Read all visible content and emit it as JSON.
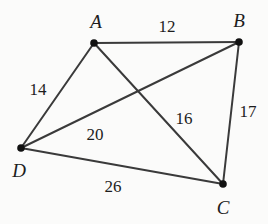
{
  "canvas": {
    "width": 268,
    "height": 224,
    "background_color": "#fbfbfa",
    "line_color": "#3a3a3a",
    "vertex_color": "#111111",
    "text_color": "#1d1d1d"
  },
  "chart_data": {
    "type": "diagram",
    "subtype": "weighted-undirected-graph",
    "title": "",
    "xlabel": "",
    "ylabel": "",
    "nodes": [
      {
        "id": "A",
        "label": "A",
        "x": 94,
        "y": 43,
        "label_x": 96,
        "label_y": 21
      },
      {
        "id": "B",
        "label": "B",
        "x": 239,
        "y": 42,
        "label_x": 239,
        "label_y": 20
      },
      {
        "id": "C",
        "label": "C",
        "x": 223,
        "y": 184,
        "label_x": 223,
        "label_y": 207
      },
      {
        "id": "D",
        "label": "D",
        "x": 21,
        "y": 148,
        "label_x": 19,
        "label_y": 170
      }
    ],
    "edges": [
      {
        "from": "A",
        "to": "B",
        "weight": 12,
        "label": "12",
        "label_x": 167,
        "label_y": 26
      },
      {
        "from": "A",
        "to": "D",
        "weight": 14,
        "label": "14",
        "label_x": 38,
        "label_y": 89
      },
      {
        "from": "A",
        "to": "C",
        "weight": 16,
        "label": "16",
        "label_x": 184,
        "label_y": 118
      },
      {
        "from": "D",
        "to": "B",
        "weight": 20,
        "label": "20",
        "label_x": 95,
        "label_y": 134
      },
      {
        "from": "B",
        "to": "C",
        "weight": 17,
        "label": "17",
        "label_x": 248,
        "label_y": 111
      },
      {
        "from": "D",
        "to": "C",
        "weight": 26,
        "label": "26",
        "label_x": 113,
        "label_y": 186
      }
    ],
    "legend": [],
    "annotations": []
  }
}
